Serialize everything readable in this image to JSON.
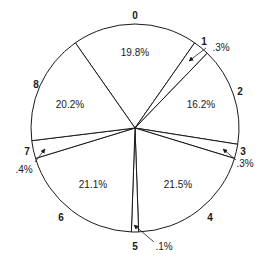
{
  "chart_data": {
    "type": "pie",
    "title": "",
    "categories": [
      "0",
      "1",
      "2",
      "3",
      "4",
      "5",
      "6",
      "7",
      "8"
    ],
    "values": [
      19.8,
      0.3,
      16.2,
      0.3,
      21.5,
      0.1,
      21.1,
      0.4,
      20.2
    ],
    "value_labels": [
      "19.8%",
      ".3%",
      "16.2%",
      ".3%",
      "21.5%",
      ".1%",
      "21.1%",
      ".4%",
      "20.2%"
    ],
    "note": "Values are transcribed from the printed slice labels and sum to 100.1% (rounding in the original figure); they are not renormalized.",
    "fill_color": "#ffffff",
    "stroke_color": "#1a1a1a",
    "legend": "none",
    "geometry": {
      "cx": 135,
      "cy": 128,
      "r": 104,
      "boundary_angles_deg_clockwise_from_top": [
        325,
        35,
        44,
        99,
        107,
        178,
        182,
        253,
        263
      ]
    },
    "slice_labels": [
      {
        "id": "0",
        "x": 135,
        "y": 19
      },
      {
        "id": "1",
        "x": 204,
        "y": 45
      },
      {
        "id": "2",
        "x": 240,
        "y": 95
      },
      {
        "id": "3",
        "x": 243,
        "y": 155
      },
      {
        "id": "4",
        "x": 210,
        "y": 221
      },
      {
        "id": "5",
        "x": 135,
        "y": 250
      },
      {
        "id": "6",
        "x": 61,
        "y": 221
      },
      {
        "id": "7",
        "x": 27,
        "y": 155
      },
      {
        "id": "8",
        "x": 36,
        "y": 88
      }
    ],
    "value_label_positions": [
      {
        "x": 135,
        "y": 56,
        "outside": false
      },
      {
        "x": 221,
        "y": 51,
        "outside": true,
        "arrow_from": [
          206,
          48
        ],
        "arrow_to": [
          189,
          61
        ]
      },
      {
        "x": 201,
        "y": 108,
        "outside": false
      },
      {
        "x": 245,
        "y": 167,
        "outside": true,
        "arrow_from": [
          236,
          160
        ],
        "arrow_to": [
          223,
          149
        ]
      },
      {
        "x": 178,
        "y": 188,
        "outside": false
      },
      {
        "x": 164,
        "y": 250,
        "outside": true,
        "arrow_from": [
          154,
          242
        ],
        "arrow_to": [
          134,
          225
        ]
      },
      {
        "x": 93,
        "y": 188,
        "outside": false
      },
      {
        "x": 24,
        "y": 173,
        "outside": true,
        "arrow_from": [
          35,
          162
        ],
        "arrow_to": [
          45,
          149
        ]
      },
      {
        "x": 70,
        "y": 108,
        "outside": false
      }
    ]
  }
}
